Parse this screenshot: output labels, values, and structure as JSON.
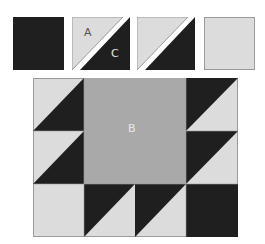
{
  "colors": {
    "dark": "#1f1f1f",
    "light": "#dcdcdc",
    "medium": "#a9a9a9",
    "outline": "#9a9a9a",
    "background": "#ffffff"
  },
  "pieces": [
    {
      "name": "dark-square",
      "type": "square",
      "fill": "dark"
    },
    {
      "name": "half-square-triangle-labeled",
      "type": "hst",
      "labels": [
        "A",
        "C"
      ]
    },
    {
      "name": "half-square-triangle",
      "type": "hst",
      "labels": []
    },
    {
      "name": "light-square",
      "type": "square",
      "fill": "light"
    }
  ],
  "labels": {
    "a": "A",
    "c": "C",
    "b": "B"
  },
  "block": {
    "grid": {
      "cols": 4,
      "rows": 3
    },
    "center_label": "B"
  }
}
